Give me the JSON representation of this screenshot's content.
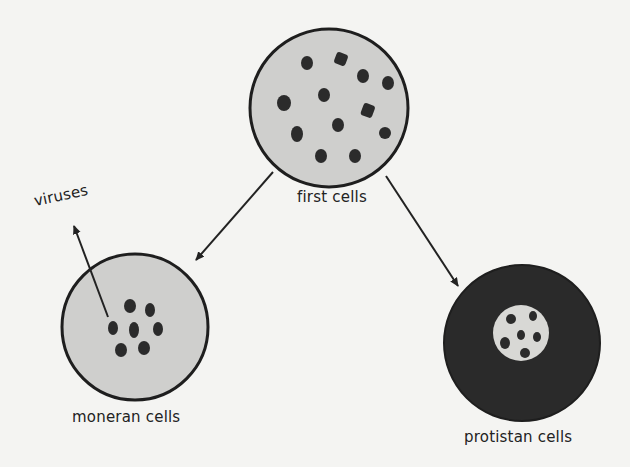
{
  "diagram": {
    "nodes": [
      {
        "id": "first",
        "label": "first cells"
      },
      {
        "id": "moneran",
        "label": "moneran cells"
      },
      {
        "id": "protistan",
        "label": "protistan cells"
      },
      {
        "id": "viruses",
        "label": "viruses"
      }
    ],
    "edges": [
      {
        "from": "first",
        "to": "moneran"
      },
      {
        "from": "first",
        "to": "protistan"
      },
      {
        "from": "moneran",
        "to": "viruses"
      }
    ]
  },
  "colors": {
    "background": "#f4f4f2",
    "cell_fill_light": "#cfcfcd",
    "cell_fill_dark": "#2a2a2a",
    "outline": "#1e1e1e",
    "nucleus_spot": "#2b2b2b"
  }
}
